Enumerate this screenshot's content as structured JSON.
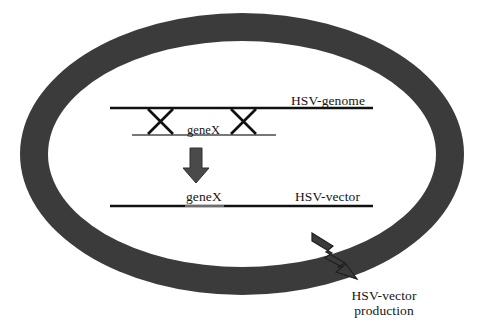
{
  "figure": {
    "background_color": "#ffffff"
  },
  "ring": {
    "name": "hsv-genome-circle",
    "fill_color": "#3b3b3b",
    "outer": {
      "cx": 242,
      "cy": 154,
      "rx": 222,
      "ry": 141
    },
    "inner": {
      "cx": 242,
      "cy": 154,
      "rx": 194,
      "ry": 113
    }
  },
  "diagram": {
    "line_color": "#111111",
    "genome_line": {
      "label": "HSV-genome",
      "x1": 110,
      "x2": 373,
      "y": 108
    },
    "plasmid_line": {
      "label": "geneX",
      "x1": 132,
      "x2": 276,
      "y": 135
    },
    "crossovers": [
      {
        "name": "crossover-left",
        "x_left": 148,
        "x_right": 174
      },
      {
        "name": "crossover-right",
        "x_left": 230,
        "x_right": 256
      }
    ],
    "recombination_arrow": {
      "name": "down-arrow",
      "x": 196,
      "y_top": 148,
      "y_bottom": 183
    },
    "vector_line": {
      "labels": [
        "geneX",
        "HSV-vector"
      ],
      "x1": 110,
      "x2": 373,
      "y": 206,
      "insert_x1": 185,
      "insert_x2": 224
    },
    "output_arrow": {
      "name": "lightning-arrow",
      "caption_line1": "HSV-vector",
      "caption_line2": "production"
    }
  },
  "labels": {
    "hsv_genome": "HSV-genome",
    "gene_x_donor": "geneX",
    "gene_x_vector": "geneX",
    "hsv_vector": "HSV-vector",
    "production_line1": "HSV-vector",
    "production_line2": "production"
  }
}
